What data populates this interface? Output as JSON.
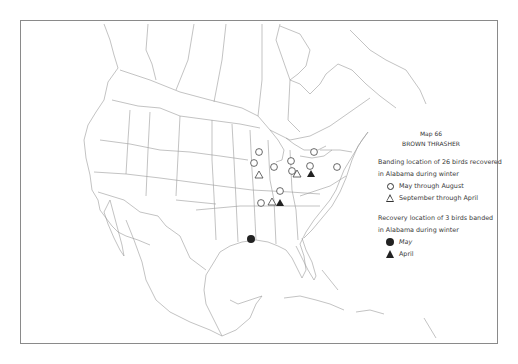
{
  "map": {
    "number_label": "Map 66",
    "species": "BROWN THRASHER"
  },
  "legend": {
    "banding_heading_line1": "Banding location of 26 birds recovered",
    "banding_heading_line2": "in Alabama during winter",
    "banding_items": [
      {
        "symbol": "open-circle",
        "label": "May through August"
      },
      {
        "symbol": "open-triangle",
        "label": "September through April"
      }
    ],
    "recovery_heading_line1": "Recovery location of 3 birds banded",
    "recovery_heading_line2": "in Alabama during winter",
    "recovery_items": [
      {
        "symbol": "filled-circle",
        "label": "May"
      },
      {
        "symbol": "filled-triangle",
        "label": "April"
      }
    ]
  },
  "markers": {
    "open_circles": [
      [
        259,
        152
      ],
      [
        254,
        163
      ],
      [
        274,
        167
      ],
      [
        291,
        161
      ],
      [
        292,
        171
      ],
      [
        314,
        152
      ],
      [
        310,
        166
      ],
      [
        337,
        167
      ],
      [
        280,
        191
      ],
      [
        261,
        203
      ]
    ],
    "open_triangles": [
      [
        259,
        175
      ],
      [
        297,
        174
      ],
      [
        272,
        202
      ]
    ],
    "filled_triangles": [
      [
        311,
        174
      ],
      [
        280,
        203
      ]
    ],
    "filled_circles": [
      [
        251,
        239
      ]
    ]
  },
  "colors": {
    "line": "#9a9a9a",
    "border": "#8a8a8a",
    "symbol": "#222222"
  }
}
